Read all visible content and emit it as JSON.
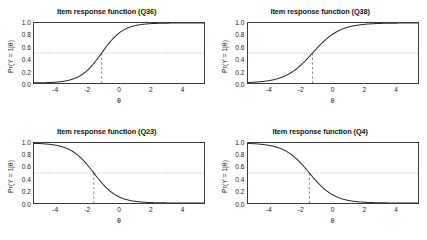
{
  "figure": {
    "layout": "2x2 grid of item response function panels",
    "background_color": "#ffffff",
    "curve_color": "#2b2b2b",
    "reference_line_color": "#b8b8b8",
    "difficulty_line_color": "#6e6e6e",
    "frame_color": "#3a3a3a"
  },
  "axes": {
    "x_label": "θ",
    "y_label": "Pr(Y = 1|θ)",
    "x_ticks": [
      "-4",
      "-2",
      "0",
      "2",
      "4"
    ],
    "x_tick_values": [
      -4,
      -2,
      0,
      2,
      4
    ],
    "y_ticks": [
      "1.0",
      "0.8",
      "0.6",
      "0.4",
      "0.2",
      "0.0"
    ],
    "y_tick_values": [
      1.0,
      0.8,
      0.6,
      0.4,
      0.2,
      0.0
    ],
    "xlim": [
      -5.4,
      5.4
    ],
    "ylim": [
      0.0,
      1.0
    ]
  },
  "chart_data": [
    {
      "type": "line",
      "title": "Item response function (Q36)",
      "item": "Q36",
      "xlabel": "θ",
      "ylabel": "Pr(Y = 1|θ)",
      "xlim": [
        -5.4,
        5.4
      ],
      "ylim": [
        0.0,
        1.0
      ],
      "grid": false,
      "direction": "increasing",
      "discrimination": 1.45,
      "difficulty": -1.1,
      "horizontal_reference": 0.5,
      "vertical_reference": -1.1,
      "x": [
        -5.4,
        -5,
        -4.5,
        -4,
        -3.5,
        -3,
        -2.5,
        -2,
        -1.5,
        -1.1,
        -1,
        -0.5,
        0,
        0.5,
        1,
        1.5,
        2,
        2.5,
        3,
        3.5,
        4,
        4.5,
        5,
        5.4
      ],
      "y": [
        0.002,
        0.003,
        0.006,
        0.013,
        0.026,
        0.053,
        0.103,
        0.194,
        0.337,
        0.5,
        0.531,
        0.698,
        0.827,
        0.908,
        0.953,
        0.977,
        0.988,
        0.994,
        0.997,
        0.999,
        0.999,
        1.0,
        1.0,
        1.0
      ]
    },
    {
      "type": "line",
      "title": "Item response function (Q38)",
      "item": "Q38",
      "xlabel": "θ",
      "ylabel": "Pr(Y = 1|θ)",
      "xlim": [
        -5.4,
        5.4
      ],
      "ylim": [
        0.0,
        1.0
      ],
      "grid": false,
      "direction": "increasing",
      "discrimination": 1.15,
      "difficulty": -1.3,
      "horizontal_reference": 0.5,
      "vertical_reference": -1.3,
      "x": [
        -5.4,
        -5,
        -4.5,
        -4,
        -3.5,
        -3,
        -2.5,
        -2,
        -1.5,
        -1.3,
        -1,
        -0.5,
        0,
        0.5,
        1,
        1.5,
        2,
        2.5,
        3,
        3.5,
        4,
        4.5,
        5,
        5.4
      ],
      "y": [
        0.009,
        0.014,
        0.024,
        0.041,
        0.07,
        0.116,
        0.188,
        0.289,
        0.415,
        0.5,
        0.546,
        0.689,
        0.807,
        0.887,
        0.936,
        0.964,
        0.98,
        0.989,
        0.994,
        0.996,
        0.998,
        0.999,
        0.999,
        1.0
      ]
    },
    {
      "type": "line",
      "title": "Item response function (Q23)",
      "item": "Q23",
      "xlabel": "θ",
      "ylabel": "Pr(Y = 1|θ)",
      "xlim": [
        -5.4,
        5.4
      ],
      "ylim": [
        0.0,
        1.0
      ],
      "grid": false,
      "direction": "decreasing",
      "discrimination": -1.35,
      "difficulty": -1.6,
      "horizontal_reference": 0.5,
      "vertical_reference": -1.6,
      "x": [
        -5.4,
        -5,
        -4.5,
        -4,
        -3.5,
        -3,
        -2.5,
        -2,
        -1.6,
        -1.5,
        -1,
        -0.5,
        0,
        0.5,
        1,
        1.5,
        2,
        2.5,
        3,
        3.5,
        4,
        4.5,
        5,
        5.4
      ],
      "y": [
        0.995,
        0.992,
        0.985,
        0.973,
        0.95,
        0.911,
        0.845,
        0.744,
        0.5,
        0.559,
        0.311,
        0.186,
        0.102,
        0.053,
        0.027,
        0.014,
        0.007,
        0.003,
        0.002,
        0.001,
        0.001,
        0.0,
        0.0,
        0.0
      ]
    },
    {
      "type": "line",
      "title": "Item response function (Q4)",
      "item": "Q4",
      "xlabel": "θ",
      "ylabel": "Pr(Y = 1|θ)",
      "xlim": [
        -5.4,
        5.4
      ],
      "ylim": [
        0.0,
        1.0
      ],
      "grid": false,
      "direction": "decreasing",
      "discrimination": -1.25,
      "difficulty": -1.5,
      "horizontal_reference": 0.5,
      "vertical_reference": -1.5,
      "x": [
        -5.4,
        -5,
        -4.5,
        -4,
        -3.5,
        -3,
        -2.5,
        -2,
        -1.5,
        -1,
        -0.5,
        0,
        0.5,
        1,
        1.5,
        2,
        2.5,
        3,
        3.5,
        4,
        4.5,
        5,
        5.4
      ],
      "y": [
        0.992,
        0.988,
        0.979,
        0.963,
        0.935,
        0.889,
        0.817,
        0.713,
        0.5,
        0.323,
        0.191,
        0.106,
        0.056,
        0.029,
        0.015,
        0.008,
        0.004,
        0.002,
        0.001,
        0.001,
        0.0,
        0.0,
        0.0
      ]
    }
  ]
}
